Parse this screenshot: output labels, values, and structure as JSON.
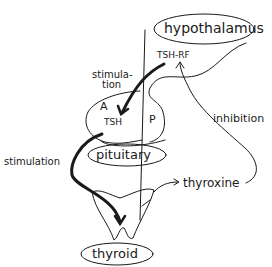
{
  "diagram": {
    "labels": {
      "hypothalamus": "hypothalamus",
      "tsh_rf": "TSH-RF",
      "stimulation_top_1": "stimula-",
      "stimulation_top_2": "tion",
      "anterior": "A",
      "posterior": "P",
      "tsh": "TSH",
      "inhibition": "inhibition",
      "pituitary": "pituitary",
      "stimulation_bottom": "stimulation",
      "thyroxine": "thyroxine",
      "thyroid": "thyroid"
    },
    "colors": {
      "ink": "#1a1a1a",
      "background": "#ffffff"
    }
  }
}
